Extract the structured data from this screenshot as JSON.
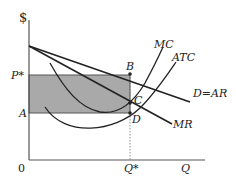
{
  "diagram": {
    "type": "monopoly-profit-diagram",
    "axes": {
      "y_label": "$",
      "x_label": "Q",
      "origin_label": "0"
    },
    "price_labels": {
      "p_star": "P*",
      "a": "A"
    },
    "quantity_labels": {
      "q_star": "Q*"
    },
    "points": {
      "b": "B",
      "c": "C",
      "d": "D"
    },
    "curves": {
      "mc": "MC",
      "atc": "ATC",
      "demand": "D=AR",
      "mr": "MR"
    },
    "colors": {
      "line": "#222222",
      "axis": "#555555",
      "shade": "#a9a9a9",
      "background": "#ffffff"
    }
  }
}
